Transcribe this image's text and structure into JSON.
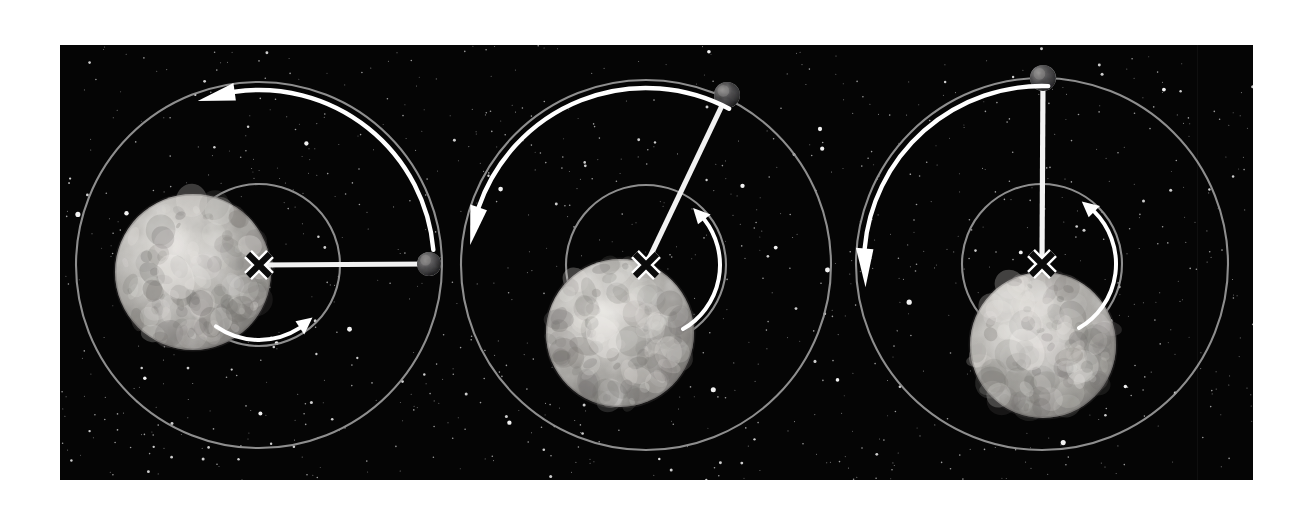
{
  "figure": {
    "background_color": "#ffffff",
    "plate_color": "#050505",
    "plate": {
      "x": 60,
      "y": 45,
      "width": 1193,
      "height": 435
    },
    "orbit_color": "#9a9a9a",
    "arrow_color": "#ffffff",
    "radius_line_color": "#f2f2f2",
    "marker_fill": "#0b0b0b",
    "marker_outline": "#ffffff",
    "planet_colors": {
      "light": "#d8d6d2",
      "mid": "#a9a7a3",
      "dark": "#6e6c69"
    },
    "satellite_colors": {
      "light": "#8e8d8b",
      "dark": "#2a2a2c"
    },
    "star_color": "#ffffff"
  },
  "chart_data": {
    "type": "diagram",
    "panel_count": 3,
    "panels": [
      {
        "index": 1,
        "label": "Phase 1",
        "barycenter": {
          "x": 259,
          "y": 265,
          "marker": "X"
        },
        "planet": {
          "cx": 193,
          "cy": 272,
          "r": 78
        },
        "satellite": {
          "cx": 429,
          "cy": 264,
          "r": 12,
          "angle_deg": 0
        },
        "inner_orbit": {
          "cx": 259,
          "cy": 265,
          "r": 81
        },
        "outer_orbit": {
          "cx": 259,
          "cy": 265,
          "r": 183
        },
        "radius_line": {
          "from": [
            259,
            265
          ],
          "to": [
            429,
            264
          ]
        },
        "outer_arrow": {
          "direction": "counterclockwise",
          "start_deg": 5,
          "end_deg": 105,
          "head": "left"
        },
        "inner_arrow": {
          "direction": "counterclockwise",
          "start_deg": 235,
          "end_deg": 310,
          "head": "upper-right"
        }
      },
      {
        "index": 2,
        "label": "Phase 2",
        "barycenter": {
          "x": 646,
          "y": 265,
          "marker": "X"
        },
        "planet": {
          "cx": 620,
          "cy": 333,
          "r": 74
        },
        "satellite": {
          "cx": 727,
          "cy": 95,
          "r": 13,
          "angle_deg": 65
        },
        "inner_orbit": {
          "cx": 646,
          "cy": 265,
          "r": 80
        },
        "outer_orbit": {
          "cx": 646,
          "cy": 265,
          "r": 185
        },
        "radius_line": {
          "from": [
            646,
            265
          ],
          "to": [
            727,
            95
          ]
        },
        "outer_arrow": {
          "direction": "counterclockwise",
          "start_deg": 62,
          "end_deg": 168,
          "head": "lower-left"
        },
        "inner_arrow": {
          "direction": "counterclockwise",
          "start_deg": 300,
          "end_deg": 45,
          "head": "up"
        }
      },
      {
        "index": 3,
        "label": "Phase 3",
        "barycenter": {
          "x": 1042,
          "y": 264,
          "marker": "X"
        },
        "planet": {
          "cx": 1043,
          "cy": 345,
          "r": 73
        },
        "satellite": {
          "cx": 1043,
          "cy": 78,
          "r": 13,
          "angle_deg": 90
        },
        "inner_orbit": {
          "cx": 1042,
          "cy": 264,
          "r": 80
        },
        "outer_orbit": {
          "cx": 1042,
          "cy": 264,
          "r": 186
        },
        "radius_line": {
          "from": [
            1042,
            264
          ],
          "to": [
            1043,
            78
          ]
        },
        "outer_arrow": {
          "direction": "counterclockwise",
          "start_deg": 88,
          "end_deg": 182,
          "head": "down"
        },
        "inner_arrow": {
          "direction": "counterclockwise",
          "start_deg": 300,
          "end_deg": 52,
          "head": "up"
        }
      }
    ]
  }
}
